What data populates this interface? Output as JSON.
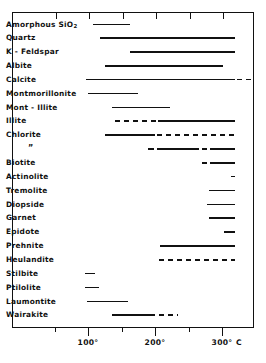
{
  "chart_data": {
    "type": "bar",
    "title": "",
    "xlabel": "Temperature",
    "ylabel": "",
    "unit_label": "C",
    "xlim": [
      0,
      320
    ],
    "grid": false,
    "legend": "none",
    "axis_ticks_major": [
      {
        "value": 100,
        "label": "100°"
      },
      {
        "value": 200,
        "label": "200°"
      },
      {
        "value": 300,
        "label": "300°"
      }
    ],
    "axis_ticks_minor": [
      50,
      150,
      250
    ],
    "categories": [
      "Amorphous SiO2",
      "Quartz",
      "K - Feldspar",
      "Albite",
      "Calcite",
      "Montmorillonite",
      "Mont - Illite",
      "Illite",
      "Chlorite",
      "”",
      "Biotite",
      "Actinolite",
      "Tremolite",
      "Diopside",
      "Garnet",
      "Epidote",
      "Prehnite",
      "Heulandite",
      "Stilbite",
      "Ptilolite",
      "Laumontite",
      "Wairakite"
    ],
    "rows": [
      {
        "label": "Amorphous SiO",
        "sub": "2",
        "segments": [
          {
            "start": 108,
            "end": 163,
            "style": "solid"
          }
        ]
      },
      {
        "label": "Quartz",
        "sub": "",
        "segments": [
          {
            "start": 118,
            "end": 320,
            "style": "solid"
          }
        ]
      },
      {
        "label": "K - Feldspar",
        "sub": "",
        "segments": [
          {
            "start": 162,
            "end": 320,
            "style": "solid"
          }
        ]
      },
      {
        "label": "Albite",
        "sub": "",
        "segments": [
          {
            "start": 126,
            "end": 302,
            "style": "solid"
          }
        ]
      },
      {
        "label": "Calcite",
        "sub": "",
        "segments": [
          {
            "start": 97,
            "end": 319,
            "style": "solid"
          },
          {
            "start": 322,
            "end": 350,
            "style": "dashed"
          }
        ]
      },
      {
        "label": "Montmorillonite",
        "sub": "",
        "segments": [
          {
            "start": 100,
            "end": 175,
            "style": "solid"
          }
        ]
      },
      {
        "label": "Mont - Illite",
        "sub": "",
        "segments": [
          {
            "start": 136,
            "end": 222,
            "style": "solid"
          }
        ]
      },
      {
        "label": "Illite",
        "sub": "",
        "segments": [
          {
            "start": 140,
            "end": 205,
            "style": "dashed"
          },
          {
            "start": 205,
            "end": 320,
            "style": "solid"
          }
        ]
      },
      {
        "label": "Chlorite",
        "sub": "",
        "segments": [
          {
            "start": 125,
            "end": 200,
            "style": "solid"
          },
          {
            "start": 203,
            "end": 320,
            "style": "dashed"
          }
        ]
      },
      {
        "label": "”",
        "sub": "",
        "segments": [
          {
            "start": 190,
            "end": 198,
            "style": "solid"
          },
          {
            "start": 203,
            "end": 265,
            "style": "solid"
          },
          {
            "start": 270,
            "end": 278,
            "style": "solid"
          },
          {
            "start": 282,
            "end": 320,
            "style": "solid"
          }
        ]
      },
      {
        "label": "Biotite",
        "sub": "",
        "segments": [
          {
            "start": 270,
            "end": 278,
            "style": "solid"
          },
          {
            "start": 282,
            "end": 320,
            "style": "solid"
          }
        ]
      },
      {
        "label": "Actinolite",
        "sub": "",
        "segments": [
          {
            "start": 313,
            "end": 320,
            "style": "solid"
          }
        ]
      },
      {
        "label": "Tremolite",
        "sub": "",
        "segments": [
          {
            "start": 280,
            "end": 320,
            "style": "solid"
          }
        ]
      },
      {
        "label": "Diopside",
        "sub": "",
        "segments": [
          {
            "start": 278,
            "end": 320,
            "style": "solid"
          }
        ]
      },
      {
        "label": "Garnet",
        "sub": "",
        "segments": [
          {
            "start": 281,
            "end": 320,
            "style": "solid"
          }
        ]
      },
      {
        "label": "Epidote",
        "sub": "",
        "segments": [
          {
            "start": 303,
            "end": 320,
            "style": "solid"
          }
        ]
      },
      {
        "label": "Prehnite",
        "sub": "",
        "segments": [
          {
            "start": 208,
            "end": 320,
            "style": "solid"
          }
        ]
      },
      {
        "label": "Heulandite",
        "sub": "",
        "segments": [
          {
            "start": 206,
            "end": 320,
            "style": "dashed"
          }
        ]
      },
      {
        "label": "Stilbite",
        "sub": "",
        "segments": [
          {
            "start": 96,
            "end": 110,
            "style": "solid"
          }
        ]
      },
      {
        "label": "Ptilolite",
        "sub": "",
        "segments": [
          {
            "start": 96,
            "end": 117,
            "style": "solid"
          }
        ]
      },
      {
        "label": "Laumontite",
        "sub": "",
        "segments": [
          {
            "start": 99,
            "end": 160,
            "style": "solid"
          }
        ]
      },
      {
        "label": "Wairakite",
        "sub": "",
        "segments": [
          {
            "start": 136,
            "end": 200,
            "style": "solid"
          },
          {
            "start": 206,
            "end": 235,
            "style": "dashed"
          }
        ]
      }
    ]
  },
  "axis": {
    "major": [
      {
        "value": 100,
        "label": "100°"
      },
      {
        "value": 200,
        "label": "200°"
      },
      {
        "value": 300,
        "label": "300°"
      }
    ],
    "minor": [
      50,
      150,
      250
    ],
    "unit": "C"
  }
}
